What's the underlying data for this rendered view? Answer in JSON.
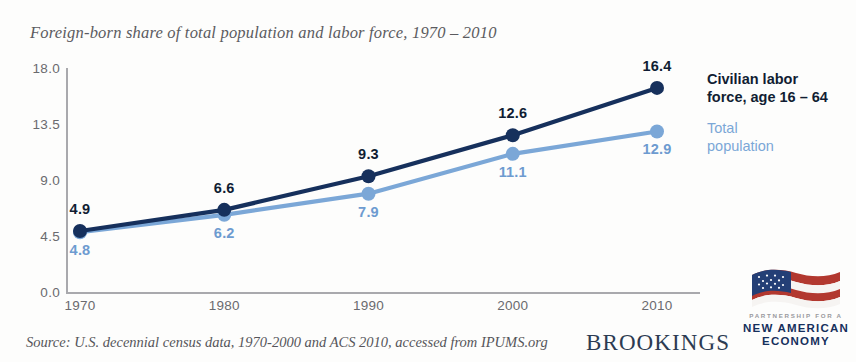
{
  "chart_data": {
    "type": "line",
    "title": "Foreign-born share of total population and labor force, 1970 – 2010",
    "xlabel": "",
    "ylabel": "",
    "categories": [
      "1970",
      "1980",
      "1990",
      "2000",
      "2010"
    ],
    "x": [
      1970,
      1980,
      1990,
      2000,
      2010
    ],
    "yticks": [
      "0.0",
      "4.5",
      "9.0",
      "13.5",
      "18.0"
    ],
    "ylim": [
      0,
      18
    ],
    "grid": false,
    "legend_position": "right",
    "series": [
      {
        "name": "Civilian labor force, age 16 – 64",
        "color": "#16305c",
        "values": [
          4.9,
          6.6,
          9.3,
          12.6,
          16.4
        ],
        "labels": [
          "4.9",
          "6.6",
          "9.3",
          "12.6",
          "16.4"
        ]
      },
      {
        "name": "Total population",
        "color": "#7ba7d7",
        "values": [
          4.8,
          6.2,
          7.9,
          11.1,
          12.9
        ],
        "labels": [
          "4.8",
          "6.2",
          "7.9",
          "11.1",
          "12.9"
        ]
      }
    ],
    "source": "Source: U.S. decennial census data, 1970-2000 and ACS 2010, accessed from IPUMS.org"
  },
  "legend": {
    "entries": [
      {
        "lines": [
          "Civilian labor",
          "force, age 16 – 64"
        ],
        "color": "#16305c"
      },
      {
        "lines": [
          "Total",
          "population"
        ],
        "color": "#7ba7d7"
      }
    ]
  },
  "branding": {
    "brookings": "BROOKINGS",
    "nae": {
      "line1": "PARTNERSHIP FOR A",
      "line2": "NEW AMERICAN",
      "line3": "ECONOMY"
    }
  }
}
